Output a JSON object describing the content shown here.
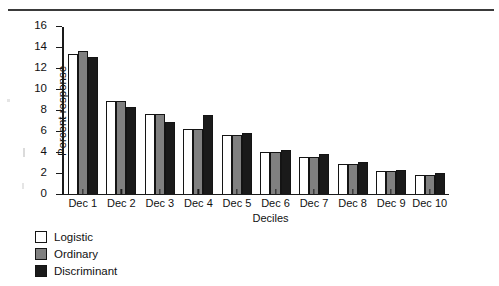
{
  "chart_data": {
    "type": "bar",
    "title": "",
    "xlabel": "Deciles",
    "ylabel": "Percent response",
    "ylim": [
      0,
      16
    ],
    "yticks": [
      0,
      2,
      4,
      6,
      8,
      10,
      12,
      14,
      16
    ],
    "grid": false,
    "legend_position": "below-left",
    "categories": [
      "Dec 1",
      "Dec 2",
      "Dec 3",
      "Dec 4",
      "Dec 5",
      "Dec 6",
      "Dec 7",
      "Dec 8",
      "Dec 9",
      "Dec 10"
    ],
    "series": [
      {
        "name": "Logistic",
        "color": "#ffffff",
        "values": [
          13.4,
          8.85,
          7.6,
          6.2,
          5.65,
          4.0,
          3.55,
          2.8,
          2.15,
          1.75
        ]
      },
      {
        "name": "Ordinary",
        "color": "#808080",
        "values": [
          13.7,
          8.85,
          7.6,
          6.2,
          5.65,
          4.0,
          3.55,
          2.8,
          2.15,
          1.8
        ]
      },
      {
        "name": "Discriminant",
        "color": "#1a1a1a",
        "values": [
          13.1,
          8.3,
          6.9,
          7.55,
          5.85,
          4.15,
          3.75,
          3.0,
          2.3,
          1.95
        ]
      }
    ]
  },
  "axes": {
    "y_title": "Percent response",
    "x_title": "Deciles",
    "y_tick_labels": [
      "0",
      "2",
      "4",
      "6",
      "8",
      "10",
      "12",
      "14",
      "16"
    ],
    "x_tick_labels": [
      "Dec 1",
      "Dec 2",
      "Dec 3",
      "Dec 4",
      "Dec 5",
      "Dec 6",
      "Dec 7",
      "Dec 8",
      "Dec 9",
      "Dec 10"
    ]
  },
  "legend": {
    "items": [
      {
        "label": "Logistic",
        "color": "#ffffff"
      },
      {
        "label": "Ordinary",
        "color": "#808080"
      },
      {
        "label": "Discriminant",
        "color": "#1a1a1a"
      }
    ]
  }
}
